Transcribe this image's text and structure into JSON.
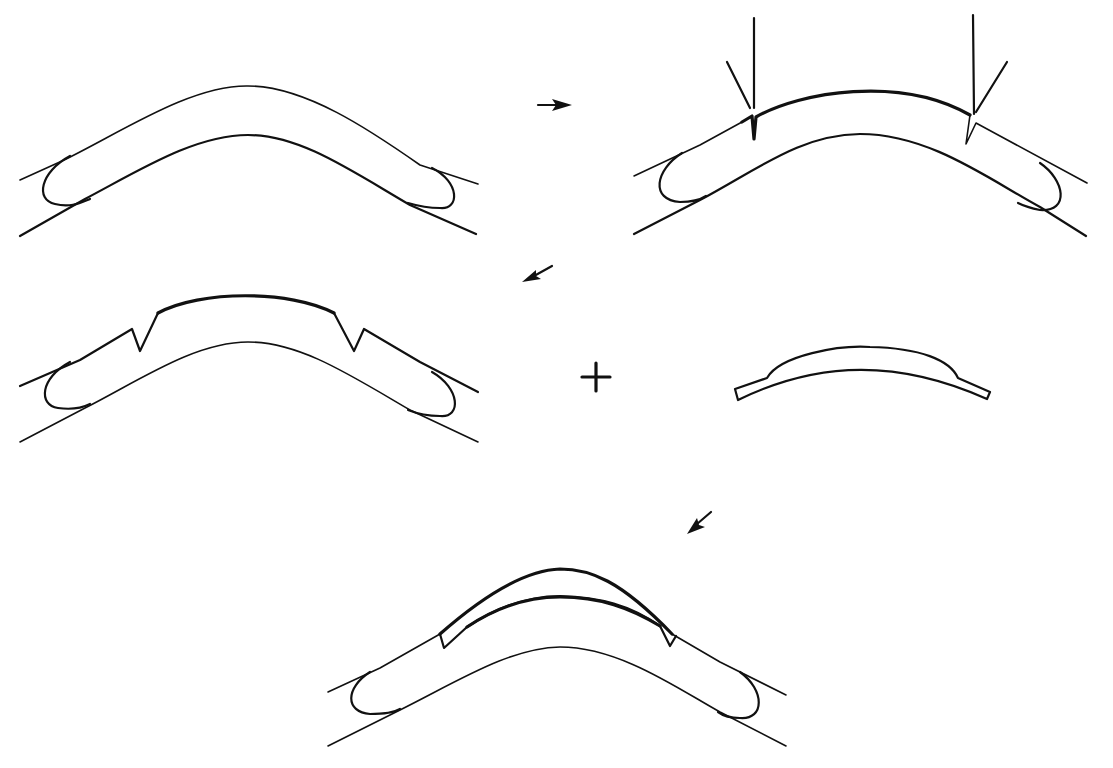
{
  "diagram": {
    "background": "#ffffff",
    "ink": "#111111",
    "panels": [
      {
        "id": "step-1-original",
        "paths": [
          {
            "d": "M 20 180 L 62 161 C 120 133 190 85 248 86 C 305 86 370 130 420 165 L 478 184",
            "w": "thin"
          },
          {
            "d": "M 20 236 L 85 199 C 140 170 195 135 248 135 C 300 135 350 170 410 205 L 476 234",
            "w": "mid"
          },
          {
            "d": "M 70 156 C 40 172 35 200 55 204 C 70 208 80 203 90 199",
            "w": "mid"
          },
          {
            "d": "M 432 168 C 460 182 460 210 440 208 C 428 208 418 206 408 203",
            "w": "mid"
          }
        ]
      },
      {
        "id": "step-2-incisions",
        "paths": [
          {
            "d": "M 634 176 L 700 145 L 742 122",
            "w": "thin"
          },
          {
            "d": "M 742 122 L 752 116 L 754 139 L 756 117 C 800 92 900 75 970 115",
            "w": "thick"
          },
          {
            "d": "M 970 115 L 966 144 L 976 123 L 1000 136 L 1087 183",
            "w": "thin"
          },
          {
            "d": "M 634 234 L 700 200 C 760 168 800 135 860 134 C 930 134 990 180 1040 207 L 1086 236",
            "w": "mid"
          },
          {
            "d": "M 682 153 C 655 170 650 200 680 202 C 690 202 700 200 706 196",
            "w": "mid"
          },
          {
            "d": "M 1040 163 C 1065 180 1070 212 1040 210 C 1030 208 1022 205 1018 203",
            "w": "mid"
          },
          {
            "d": "M 754 108 L 754 18",
            "w": "mid"
          },
          {
            "d": "M 727 62 L 750 108",
            "w": "mid"
          },
          {
            "d": "M 974 114 L 973 15",
            "w": "mid"
          },
          {
            "d": "M 1007 62 L 976 112",
            "w": "mid"
          }
        ]
      },
      {
        "id": "step-3-excised",
        "paths": [
          {
            "d": "M 20 386 L 80 360 L 132 329 L 140 351 L 158 313",
            "w": "mid"
          },
          {
            "d": "M 158 313 C 200 290 290 290 334 313",
            "w": "thick"
          },
          {
            "d": "M 334 313 L 354 351 L 364 329 L 420 362 L 478 392",
            "w": "mid"
          },
          {
            "d": "M 20 442 L 85 408 C 140 380 195 342 248 342 C 300 342 350 375 410 410 L 478 442",
            "w": "thin"
          },
          {
            "d": "M 70 362 C 40 378 38 405 58 408 C 72 410 82 408 90 404",
            "w": "mid"
          },
          {
            "d": "M 432 372 C 460 388 462 418 440 416 C 428 416 418 414 408 410",
            "w": "mid"
          }
        ]
      },
      {
        "id": "graft-lenticule",
        "paths": [
          {
            "d": "M 735 389 L 767 378 C 780 355 840 345 870 347 C 920 348 950 360 958 378 L 990 392 L 987 399 C 900 360 820 360 738 400 Z",
            "w": "mid"
          }
        ]
      },
      {
        "id": "step-4-sutured",
        "paths": [
          {
            "d": "M 328 692 L 380 668 L 440 634",
            "w": "thin"
          },
          {
            "d": "M 440 634 C 490 590 530 570 560 569 C 590 569 620 580 672 634",
            "w": "thick"
          },
          {
            "d": "M 672 634 L 720 662 L 786 695",
            "w": "thin"
          },
          {
            "d": "M 440 634 L 444 648 L 467 627 C 500 605 530 596 560 596 C 600 597 630 605 660 626 L 670 646 L 676 636",
            "w": "mid"
          },
          {
            "d": "M 467 627 C 500 605 530 597 560 597 C 600 597 630 608 660 626",
            "w": "thick"
          },
          {
            "d": "M 328 746 L 400 710 C 460 680 510 648 560 647 C 620 647 680 690 720 712 L 786 746",
            "w": "thin"
          },
          {
            "d": "M 370 672 C 345 688 345 712 370 714 C 385 714 395 712 400 709",
            "w": "mid"
          },
          {
            "d": "M 740 672 C 765 690 765 720 740 718 C 730 718 722 715 718 712",
            "w": "mid"
          }
        ]
      }
    ],
    "arrows": [
      {
        "id": "arrow-step1-to-step2",
        "line": "M 538 105 L 558 105",
        "head": "M 572 105 L 552 99 L 556 105 L 552 111 Z"
      },
      {
        "id": "arrow-step2-to-step3",
        "line": "M 552 266 L 534 276",
        "head": "M 522 282 L 536 270 L 536 276 L 541 279 Z"
      },
      {
        "id": "arrow-to-step4",
        "line": "M 711 512 L 697 524",
        "head": "M 687 534 L 697 518 L 699 525 L 705 527 Z"
      }
    ],
    "plus_sign": {
      "x": 596,
      "y": 377,
      "size": 14
    }
  }
}
